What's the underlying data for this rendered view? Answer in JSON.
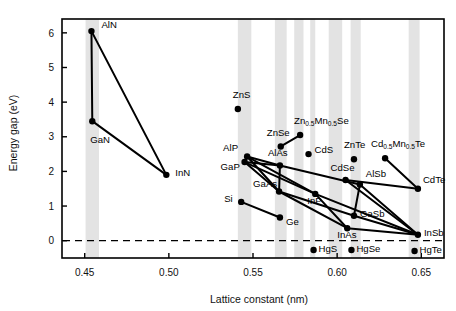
{
  "chart_data": {
    "type": "scatter",
    "title": "",
    "xlabel": "Lattice constant (nm)",
    "ylabel": "Energy gap (eV)",
    "xlim": [
      0.4365,
      0.6635
    ],
    "ylim": [
      -0.5,
      6.4
    ],
    "xticks": [
      0.45,
      0.5,
      0.55,
      0.6,
      0.65
    ],
    "xtick_labels": [
      "0.45",
      "0.50",
      "0.55",
      "0.60",
      "0.65"
    ],
    "yticks": [
      0,
      1,
      2,
      3,
      4,
      5,
      6
    ],
    "ytick_labels": [
      "0",
      "1",
      "2",
      "3",
      "4",
      "5",
      "6"
    ],
    "grid": false,
    "legend": false,
    "zero_line": {
      "y": 0,
      "style": "dashed"
    },
    "band_color": "#e3e3e3",
    "marker_color": "#000000",
    "line_color": "#000000",
    "highlight_bands": [
      {
        "x0": 0.4505,
        "x1": 0.4585
      },
      {
        "x0": 0.541,
        "x1": 0.549
      },
      {
        "x0": 0.563,
        "x1": 0.57
      },
      {
        "x0": 0.5745,
        "x1": 0.58
      },
      {
        "x0": 0.584,
        "x1": 0.587
      },
      {
        "x0": 0.595,
        "x1": 0.603
      },
      {
        "x0": 0.608,
        "x1": 0.614
      },
      {
        "x0": 0.6425,
        "x1": 0.649
      }
    ],
    "points": [
      {
        "name": "AlN",
        "label": "AlN",
        "x": 0.454,
        "y": 6.05,
        "lx": 10,
        "ly": -1
      },
      {
        "name": "GaN",
        "label": "GaN",
        "x": 0.4545,
        "y": 3.45,
        "lx": -2,
        "ly": 24
      },
      {
        "name": "InN",
        "label": "InN",
        "x": 0.4985,
        "y": 1.9,
        "lx": 9,
        "ly": 4
      },
      {
        "name": "ZnS",
        "label": "ZnS",
        "x": 0.541,
        "y": 3.8,
        "lx": -5,
        "ly": -9
      },
      {
        "name": "ZnSe",
        "label": "ZnSe",
        "x": 0.5665,
        "y": 2.72,
        "lx": -14,
        "ly": -8
      },
      {
        "name": "ZnMnSe",
        "label": "Zn0.5Mn0.5Se",
        "x": 0.578,
        "y": 3.05,
        "lx": -6,
        "ly": -9
      },
      {
        "name": "CdS",
        "label": "CdS",
        "x": 0.583,
        "y": 2.5,
        "lx": 6,
        "ly": 1
      },
      {
        "name": "ZnTe",
        "label": "ZnTe",
        "x": 0.61,
        "y": 2.35,
        "lx": -10,
        "ly": -9
      },
      {
        "name": "CdMnTe",
        "label": "Cd0.5Mn0.5Te",
        "x": 0.6285,
        "y": 2.38,
        "lx": -14,
        "ly": -9
      },
      {
        "name": "AlP",
        "label": "AlP",
        "x": 0.5465,
        "y": 2.43,
        "lx": -24,
        "ly": -3
      },
      {
        "name": "GaP",
        "label": "GaP",
        "x": 0.545,
        "y": 2.27,
        "lx": -24,
        "ly": 10
      },
      {
        "name": "AlAs",
        "label": "AlAs",
        "x": 0.566,
        "y": 2.17,
        "lx": -12,
        "ly": -7
      },
      {
        "name": "CdSe",
        "label": "CdSe",
        "x": 0.605,
        "y": 1.75,
        "lx": -15,
        "ly": -7
      },
      {
        "name": "AlSb",
        "label": "AlSb",
        "x": 0.6135,
        "y": 1.62,
        "lx": 6,
        "ly": -5
      },
      {
        "name": "CdTe",
        "label": "CdTe",
        "x": 0.648,
        "y": 1.5,
        "lx": 5,
        "ly": -3
      },
      {
        "name": "GaAs",
        "label": "GaAs",
        "x": 0.5655,
        "y": 1.42,
        "lx": -26,
        "ly": -2
      },
      {
        "name": "InP",
        "label": "InP",
        "x": 0.587,
        "y": 1.35,
        "lx": -8,
        "ly": 12
      },
      {
        "name": "Si",
        "label": "Si",
        "x": 0.543,
        "y": 1.12,
        "lx": -17,
        "ly": 3
      },
      {
        "name": "Ge",
        "label": "Ge",
        "x": 0.566,
        "y": 0.67,
        "lx": 6,
        "ly": 10
      },
      {
        "name": "GaSb",
        "label": "GaSb",
        "x": 0.61,
        "y": 0.72,
        "lx": 6,
        "ly": 4
      },
      {
        "name": "InAs",
        "label": "InAs",
        "x": 0.606,
        "y": 0.36,
        "lx": -10,
        "ly": 12
      },
      {
        "name": "InSb",
        "label": "InSb",
        "x": 0.648,
        "y": 0.17,
        "lx": 6,
        "ly": 4
      },
      {
        "name": "HgS",
        "label": "HgS",
        "x": 0.586,
        "y": -0.27,
        "lx": 5,
        "ly": 4
      },
      {
        "name": "HgSe",
        "label": "HgSe",
        "x": 0.6085,
        "y": -0.27,
        "lx": 5,
        "ly": 4
      },
      {
        "name": "HgTe",
        "label": "HgTe",
        "x": 0.646,
        "y": -0.3,
        "lx": 5,
        "ly": 4
      }
    ],
    "connections": [
      [
        "AlN",
        "GaN"
      ],
      [
        "AlN",
        "InN"
      ],
      [
        "GaN",
        "InN"
      ],
      [
        "AlP",
        "GaP"
      ],
      [
        "AlP",
        "AlAs"
      ],
      [
        "GaP",
        "AlAs"
      ],
      [
        "GaP",
        "GaAs"
      ],
      [
        "AlP",
        "GaAs"
      ],
      [
        "AlAs",
        "GaAs"
      ],
      [
        "AlAs",
        "AlSb"
      ],
      [
        "GaP",
        "InP"
      ],
      [
        "AlP",
        "InP"
      ],
      [
        "GaAs",
        "InAs"
      ],
      [
        "InP",
        "InAs"
      ],
      [
        "GaAs",
        "GaSb"
      ],
      [
        "AlSb",
        "GaSb"
      ],
      [
        "AlSb",
        "InSb"
      ],
      [
        "GaSb",
        "InSb"
      ],
      [
        "InAs",
        "InSb"
      ],
      [
        "InP",
        "InSb"
      ],
      [
        "ZnSe",
        "ZnMnSe"
      ],
      [
        "CdSe",
        "CdTe"
      ],
      [
        "CdMnTe",
        "CdTe"
      ],
      [
        "Si",
        "Ge"
      ],
      [
        "CdSe",
        "InSb"
      ]
    ]
  }
}
